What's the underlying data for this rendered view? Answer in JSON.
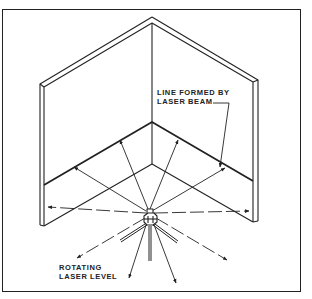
{
  "figure": {
    "type": "isometric-illustration"
  },
  "labels": {
    "beam_line1": "LINE FORMED BY",
    "beam_line2": "LASER BEAM",
    "level_line1": "ROTATING",
    "level_line2": "LASER LEVEL"
  },
  "colors": {
    "stroke": "#222222",
    "background": "#ffffff"
  }
}
